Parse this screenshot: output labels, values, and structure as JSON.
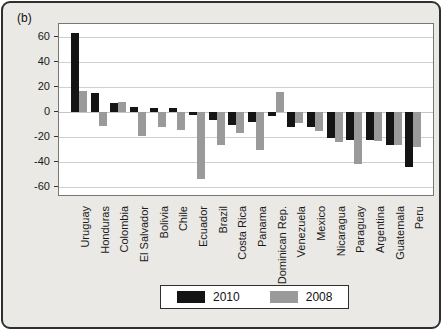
{
  "panel": {
    "label": "(b)"
  },
  "chart_data": {
    "type": "bar",
    "title": "",
    "xlabel": "",
    "ylabel": "",
    "categories": [
      "Uruguay",
      "Honduras",
      "Colombia",
      "El Salvador",
      "Bolivia",
      "Chile",
      "Ecuador",
      "Brazil",
      "Costa Rica",
      "Panama",
      "Dominican Rep.",
      "Venezuela",
      "Mexico",
      "Nicaragua",
      "Paraguay",
      "Argentina",
      "Guatemala",
      "Peru"
    ],
    "series": [
      {
        "name": "2010",
        "color": "#141414",
        "values": [
          63,
          15,
          7,
          4,
          3,
          3,
          -2,
          -6,
          -10,
          -8,
          -3,
          -12,
          -12,
          -21,
          -22,
          -22,
          -26,
          -44
        ]
      },
      {
        "name": "2008",
        "color": "#9a9a9a",
        "values": [
          17,
          -11,
          8,
          -19,
          -12,
          -14,
          -53,
          -26,
          -17,
          -30,
          16,
          -9,
          -15,
          -24,
          -41,
          -23,
          -26,
          -28
        ]
      }
    ],
    "yticks": [
      -60,
      -40,
      -20,
      0,
      20,
      40,
      60
    ],
    "ylim": [
      -66,
      70
    ],
    "grid": true,
    "legend_position": "bottom",
    "colors": {
      "plot_background": "#ffffff",
      "figure_background": "#eae9e5",
      "gridline": "#cfcfcf"
    }
  }
}
